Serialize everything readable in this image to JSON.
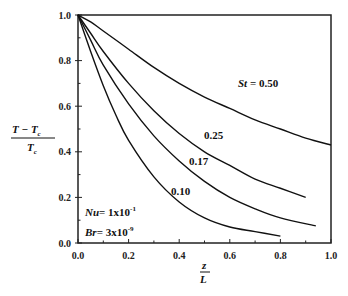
{
  "chart_data": {
    "type": "line",
    "title": "",
    "xlabel": "z/L",
    "ylabel": "(T - Tc)/Tc",
    "xlim": [
      0.0,
      1.0
    ],
    "ylim": [
      0.0,
      1.0
    ],
    "x_ticks": [
      "0.0",
      "0.2",
      "0.4",
      "0.6",
      "0.8",
      "1.0"
    ],
    "y_ticks": [
      "0.0",
      "0.2",
      "0.4",
      "0.6",
      "0.8",
      "1.0"
    ],
    "grid": false,
    "series": [
      {
        "name": "St = 0.50",
        "label": "St = 0.50",
        "x": [
          0.0,
          0.05,
          0.1,
          0.2,
          0.3,
          0.4,
          0.5,
          0.6,
          0.7,
          0.8,
          0.9,
          1.0
        ],
        "y": [
          1.0,
          0.97,
          0.93,
          0.85,
          0.77,
          0.7,
          0.64,
          0.59,
          0.54,
          0.5,
          0.46,
          0.43
        ]
      },
      {
        "name": "St = 0.25",
        "label": "0.25",
        "x": [
          0.0,
          0.05,
          0.1,
          0.2,
          0.3,
          0.4,
          0.5,
          0.6,
          0.7,
          0.8,
          0.9
        ],
        "y": [
          1.0,
          0.92,
          0.84,
          0.7,
          0.58,
          0.48,
          0.4,
          0.34,
          0.28,
          0.24,
          0.2
        ]
      },
      {
        "name": "St = 0.17",
        "label": "0.17",
        "x": [
          0.0,
          0.05,
          0.1,
          0.2,
          0.3,
          0.4,
          0.5,
          0.6,
          0.7,
          0.8,
          0.94
        ],
        "y": [
          1.0,
          0.89,
          0.78,
          0.61,
          0.47,
          0.36,
          0.27,
          0.2,
          0.15,
          0.11,
          0.075
        ]
      },
      {
        "name": "St = 0.10",
        "label": "0.10",
        "x": [
          0.0,
          0.05,
          0.1,
          0.15,
          0.2,
          0.3,
          0.4,
          0.5,
          0.6,
          0.7,
          0.8
        ],
        "y": [
          1.0,
          0.84,
          0.69,
          0.56,
          0.45,
          0.29,
          0.18,
          0.11,
          0.07,
          0.05,
          0.03
        ]
      }
    ],
    "annotations": [
      {
        "text": "St = 0.50",
        "x": 0.63,
        "y": 0.73
      },
      {
        "text": "0.25",
        "x": 0.52,
        "y": 0.44
      },
      {
        "text": "0.17",
        "x": 0.42,
        "y": 0.35
      },
      {
        "text": "0.10",
        "x": 0.28,
        "y": 0.17
      },
      {
        "text": "Nu= 1x10^-1",
        "x": 0.05,
        "y": 0.15
      },
      {
        "text": "Br= 3x10^-9",
        "x": 0.05,
        "y": 0.06
      }
    ]
  },
  "labels": {
    "y_num": "T − T",
    "y_den": "T",
    "sub_c": "c",
    "x_num": "z",
    "x_den": "L",
    "st_label": "St = 0.50",
    "st_prefix": "St",
    "st_value": " = 0.50",
    "c025": "0.25",
    "c017": "0.17",
    "c010": "0.10",
    "nu_name": "Nu",
    "nu_val": "= 1x10",
    "nu_exp": "-1",
    "br_name": "Br",
    "br_val": "= 3x10",
    "br_exp": "-9"
  }
}
